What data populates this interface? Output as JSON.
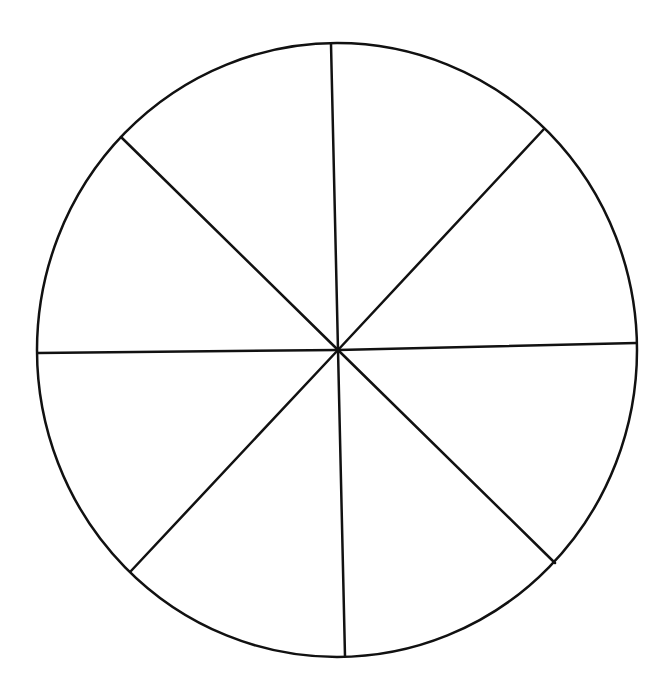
{
  "diagram": {
    "type": "segmented-circle",
    "segments": 8,
    "stroke_color": "#111111",
    "background_color": "#ffffff",
    "circle": {
      "cx": 337,
      "cy": 350,
      "rx": 300,
      "ry": 307,
      "stroke_width": 2.5
    },
    "center": {
      "x": 338,
      "y": 350
    },
    "spokes": [
      {
        "name": "top",
        "x": 331,
        "y": 44
      },
      {
        "name": "top-right",
        "x": 544,
        "y": 129
      },
      {
        "name": "right",
        "x": 636,
        "y": 343
      },
      {
        "name": "bottom-right",
        "x": 555,
        "y": 563
      },
      {
        "name": "bottom",
        "x": 345,
        "y": 656
      },
      {
        "name": "bottom-left",
        "x": 131,
        "y": 571
      },
      {
        "name": "left",
        "x": 38,
        "y": 353
      },
      {
        "name": "top-left",
        "x": 121,
        "y": 137
      }
    ],
    "spoke_width": 2.5
  }
}
